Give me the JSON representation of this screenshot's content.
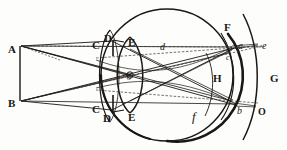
{
  "figure": {
    "kind": "line-engraving",
    "background_color": "#fdfdfc",
    "ink_color": "#1a1714",
    "width": 287,
    "height": 150
  },
  "labels": [
    {
      "id": "A",
      "text": "A",
      "style": "cap",
      "x": 8,
      "y": 44,
      "role": "object-point-top"
    },
    {
      "id": "B",
      "text": "B",
      "style": "cap",
      "x": 8,
      "y": 98,
      "role": "object-point-bottom"
    },
    {
      "id": "C1",
      "text": "C",
      "style": "cap",
      "x": 92,
      "y": 40,
      "role": "cornea-top"
    },
    {
      "id": "D1",
      "text": "D",
      "style": "cap",
      "x": 104,
      "y": 33,
      "role": "iris-top"
    },
    {
      "id": "E1",
      "text": "E",
      "style": "cap",
      "x": 128,
      "y": 37,
      "role": "lens-top"
    },
    {
      "id": "C2",
      "text": "C",
      "style": "cap",
      "x": 92,
      "y": 104,
      "role": "cornea-bottom"
    },
    {
      "id": "D2",
      "text": "D",
      "style": "cap",
      "x": 103,
      "y": 113,
      "role": "iris-bottom"
    },
    {
      "id": "E2",
      "text": "E",
      "style": "cap",
      "x": 128,
      "y": 112,
      "role": "lens-bottom"
    },
    {
      "id": "o",
      "text": "o",
      "style": "it-sm",
      "x": 127,
      "y": 74,
      "role": "lens-centre"
    },
    {
      "id": "d",
      "text": "d",
      "style": "it",
      "x": 160,
      "y": 42,
      "role": "image-point-d"
    },
    {
      "id": "F",
      "text": "F",
      "style": "cap",
      "x": 224,
      "y": 22,
      "role": "retina-top"
    },
    {
      "id": "a",
      "text": "a",
      "style": "it",
      "x": 238,
      "y": 41,
      "role": "image-point-a"
    },
    {
      "id": "e",
      "text": "e",
      "style": "it",
      "x": 262,
      "y": 41,
      "role": "image-point-e"
    },
    {
      "id": "c",
      "text": "c",
      "style": "it-sm",
      "x": 226,
      "y": 54,
      "role": "image-point-c"
    },
    {
      "id": "H",
      "text": "H",
      "style": "cap",
      "x": 213,
      "y": 73,
      "role": "optic-nerve"
    },
    {
      "id": "G",
      "text": "G",
      "style": "cap",
      "x": 270,
      "y": 73,
      "role": "outer-arc"
    },
    {
      "id": "f",
      "text": "f",
      "style": "it-lg",
      "x": 192,
      "y": 110,
      "role": "image-point-f"
    },
    {
      "id": "b",
      "text": "b",
      "style": "it",
      "x": 237,
      "y": 106,
      "role": "image-point-b"
    },
    {
      "id": "O",
      "text": "O",
      "style": "cap-sm",
      "x": 258,
      "y": 107,
      "role": "image-point-O"
    }
  ],
  "geometry": {
    "eyeball_circle": {
      "cx": 167,
      "cy": 75,
      "r": 66
    },
    "cornea_arc": {
      "description": "C-to-C anterior arc"
    },
    "lens": {
      "cx": 130,
      "cy": 75,
      "half_height": 40
    },
    "iris_bars": 2,
    "retina_arcs": 2,
    "object_height": {
      "top_y": 46,
      "bottom_y": 101,
      "x": 20
    }
  }
}
